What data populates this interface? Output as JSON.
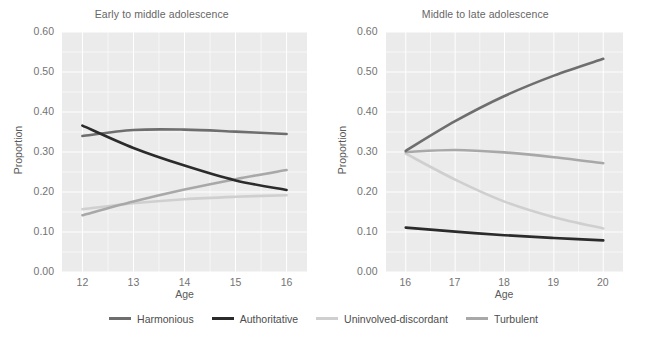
{
  "figure": {
    "background_color": "#ffffff",
    "panel_background_color": "#ebebeb",
    "gridline_color": "#ffffff",
    "legend_position": "bottom"
  },
  "series_colors": {
    "Harmonious": "#6e6e6e",
    "Authoritative": "#2b2b2b",
    "Uninvolved-discordant": "#cfcfcf",
    "Turbulent": "#a8a8a8"
  },
  "legend": {
    "items": [
      {
        "label": "Harmonious",
        "color": "#6e6e6e",
        "swatch_name": "legend-swatch-harmonious"
      },
      {
        "label": "Authoritative",
        "color": "#2b2b2b",
        "swatch_name": "legend-swatch-authoritative"
      },
      {
        "label": "Uninvolved-discordant",
        "color": "#cfcfcf",
        "swatch_name": "legend-swatch-uninvolved-discordant"
      },
      {
        "label": "Turbulent",
        "color": "#a8a8a8",
        "swatch_name": "legend-swatch-turbulent"
      }
    ]
  },
  "chart_data": [
    {
      "type": "line",
      "title": "Early to middle adolescence",
      "xlabel": "Age",
      "ylabel": "Proportion",
      "x": [
        12,
        13,
        14,
        15,
        16
      ],
      "xticklabels": [
        "12",
        "13",
        "14",
        "15",
        "16"
      ],
      "xlim": [
        11.6,
        16.4
      ],
      "ylim": [
        0.0,
        0.6
      ],
      "yticks": [
        0.0,
        0.1,
        0.2,
        0.3,
        0.4,
        0.5,
        0.6
      ],
      "yticklabels": [
        "0.00",
        "0.10",
        "0.20",
        "0.30",
        "0.40",
        "0.50",
        "0.60"
      ],
      "grid": true,
      "series": [
        {
          "name": "Harmonious",
          "color": "#6e6e6e",
          "values": [
            0.34,
            0.355,
            0.356,
            0.351,
            0.345
          ]
        },
        {
          "name": "Authoritative",
          "color": "#2b2b2b",
          "values": [
            0.366,
            0.31,
            0.266,
            0.229,
            0.205
          ]
        },
        {
          "name": "Uninvolved-discordant",
          "color": "#cfcfcf",
          "values": [
            0.157,
            0.172,
            0.182,
            0.188,
            0.192
          ]
        },
        {
          "name": "Turbulent",
          "color": "#a8a8a8",
          "values": [
            0.142,
            0.176,
            0.206,
            0.232,
            0.255
          ]
        }
      ]
    },
    {
      "type": "line",
      "title": "Middle to late adolescence",
      "xlabel": "Age",
      "ylabel": "Proportion",
      "x": [
        16,
        17,
        18,
        19,
        20
      ],
      "xticklabels": [
        "16",
        "17",
        "18",
        "19",
        "20"
      ],
      "xlim": [
        15.6,
        20.4
      ],
      "ylim": [
        0.0,
        0.6
      ],
      "yticks": [
        0.0,
        0.1,
        0.2,
        0.3,
        0.4,
        0.5,
        0.6
      ],
      "yticklabels": [
        "0.00",
        "0.10",
        "0.20",
        "0.30",
        "0.40",
        "0.50",
        "0.60"
      ],
      "grid": true,
      "series": [
        {
          "name": "Harmonious",
          "color": "#6e6e6e",
          "values": [
            0.303,
            0.377,
            0.44,
            0.491,
            0.533
          ]
        },
        {
          "name": "Authoritative",
          "color": "#2b2b2b",
          "values": [
            0.111,
            0.101,
            0.092,
            0.085,
            0.079
          ]
        },
        {
          "name": "Uninvolved-discordant",
          "color": "#cfcfcf",
          "values": [
            0.296,
            0.231,
            0.176,
            0.137,
            0.109
          ]
        },
        {
          "name": "Turbulent",
          "color": "#a8a8a8",
          "values": [
            0.3,
            0.305,
            0.299,
            0.287,
            0.272
          ]
        }
      ]
    }
  ]
}
